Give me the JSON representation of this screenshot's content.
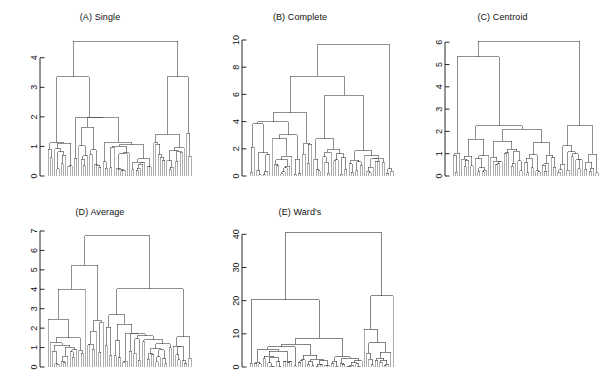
{
  "figure": {
    "background": "#ffffff",
    "line_color": "#333333",
    "leaf_color": "#8a8a8a",
    "text_color": "#111111",
    "layout": "2 rows x 3 columns (5 panels, bottom-right empty)"
  },
  "panels": [
    {
      "id": "A",
      "title": "(A) Single",
      "key": "single"
    },
    {
      "id": "B",
      "title": "(B) Complete",
      "key": "complete"
    },
    {
      "id": "C",
      "title": "(C) Centroid",
      "key": "centroid"
    },
    {
      "id": "D",
      "title": "(D) Average",
      "key": "average"
    },
    {
      "id": "E",
      "title": "(E) Ward's",
      "key": "wards"
    }
  ],
  "chart_data": [
    {
      "type": "dendrogram",
      "panel": "A",
      "title": "(A) Single",
      "linkage": "single",
      "xlabel": "",
      "ylabel": "",
      "ylim": [
        0,
        4.6
      ],
      "yticks": [
        0,
        1,
        2,
        3,
        4
      ],
      "ytick_labels": [
        "0",
        "1",
        "2",
        "3",
        "4"
      ],
      "grid": false,
      "n_leaves": 66,
      "root_height": 4.55,
      "merge_heights": [
        4.55,
        3.35,
        3.35,
        1.98,
        1.98,
        1.65,
        1.45,
        1.42,
        1.15,
        1.12,
        1.12,
        1.1,
        1.08,
        1.05,
        1.02,
        1.0,
        0.98,
        0.95,
        0.93,
        0.9,
        0.88,
        0.86,
        0.84,
        0.82,
        0.8,
        0.78,
        0.76,
        0.74,
        0.72,
        0.7,
        0.68,
        0.66,
        0.64,
        0.62,
        0.6,
        0.58,
        0.56,
        0.54,
        0.52,
        0.5,
        0.48,
        0.46,
        0.44,
        0.42,
        0.4,
        0.38,
        0.36,
        0.35,
        0.34,
        0.33,
        0.32,
        0.31,
        0.3,
        0.29,
        0.28,
        0.27,
        0.26,
        0.25,
        0.24,
        0.23,
        0.22,
        0.21,
        0.2,
        0.19,
        0.18
      ],
      "notes": "Strong chaining: one long spine at ~1.98 with most leaves merging below ~1.2"
    },
    {
      "type": "dendrogram",
      "panel": "B",
      "title": "(B) Complete",
      "linkage": "complete",
      "xlabel": "",
      "ylabel": "",
      "ylim": [
        0,
        10
      ],
      "yticks": [
        0,
        2,
        4,
        6,
        8,
        10
      ],
      "ytick_labels": [
        "0",
        "2",
        "4",
        "6",
        "8",
        "10"
      ],
      "grid": false,
      "n_leaves": 66,
      "root_height": 9.65,
      "merge_heights": [
        9.65,
        7.35,
        5.95,
        4.65,
        4.0,
        3.85,
        3.05,
        2.75,
        2.75,
        2.4,
        2.35,
        2.1,
        1.95,
        1.85,
        1.75,
        1.7,
        1.65,
        1.6,
        1.55,
        1.5,
        1.45,
        1.4,
        1.35,
        1.3,
        1.28,
        1.25,
        1.22,
        1.2,
        1.18,
        1.15,
        1.12,
        1.1,
        1.08,
        1.05,
        1.02,
        1.0,
        0.95,
        0.9,
        0.85,
        0.8,
        0.75,
        0.7,
        0.65,
        0.6,
        0.55,
        0.5,
        0.45,
        0.42,
        0.4,
        0.38,
        0.36,
        0.34,
        0.32,
        0.3,
        0.28,
        0.26,
        0.24,
        0.22,
        0.2,
        0.18,
        0.16,
        0.14,
        0.12,
        0.1,
        0.08
      ],
      "notes": "Balanced two-cluster split at 9.65; left small tight branch at 5.95"
    },
    {
      "type": "dendrogram",
      "panel": "C",
      "title": "(C) Centroid",
      "linkage": "centroid",
      "xlabel": "",
      "ylabel": "",
      "ylim": [
        0,
        6.1
      ],
      "yticks": [
        0,
        1,
        2,
        3,
        4,
        5,
        6
      ],
      "ytick_labels": [
        "0",
        "1",
        "2",
        "3",
        "4",
        "5",
        "6"
      ],
      "grid": false,
      "n_leaves": 66,
      "root_height": 6.05,
      "merge_heights": [
        6.05,
        5.35,
        2.25,
        2.25,
        2.1,
        1.65,
        1.55,
        1.5,
        1.35,
        1.2,
        1.1,
        1.08,
        1.05,
        1.03,
        1.02,
        1.0,
        0.98,
        0.96,
        0.94,
        0.92,
        0.9,
        0.88,
        0.86,
        0.84,
        0.82,
        0.8,
        0.78,
        0.76,
        0.74,
        0.72,
        0.7,
        0.68,
        0.66,
        0.64,
        0.62,
        0.6,
        0.58,
        0.56,
        0.54,
        0.52,
        0.5,
        0.48,
        0.46,
        0.44,
        0.42,
        0.4,
        0.38,
        0.36,
        0.34,
        0.32,
        0.3,
        0.28,
        0.26,
        0.25,
        0.24,
        0.23,
        0.22,
        0.21,
        0.2,
        0.19,
        0.18,
        0.17,
        0.16,
        0.15,
        0.14
      ],
      "notes": "Inversions visible; broad flat spine near 2.25, dense merges between 0.6 and 1.1"
    },
    {
      "type": "dendrogram",
      "panel": "D",
      "title": "(D) Average",
      "linkage": "average",
      "xlabel": "",
      "ylabel": "",
      "ylim": [
        0,
        7
      ],
      "yticks": [
        0,
        1,
        2,
        3,
        4,
        5,
        6,
        7
      ],
      "ytick_labels": [
        "0",
        "1",
        "2",
        "3",
        "4",
        "5",
        "6",
        "7"
      ],
      "grid": false,
      "n_leaves": 66,
      "root_height": 6.75,
      "merge_heights": [
        6.75,
        5.25,
        4.0,
        4.02,
        2.7,
        2.45,
        2.4,
        2.3,
        2.2,
        2.05,
        1.85,
        1.75,
        1.7,
        1.6,
        1.55,
        1.5,
        1.45,
        1.4,
        1.35,
        1.3,
        1.25,
        1.2,
        1.18,
        1.15,
        1.12,
        1.1,
        1.08,
        1.05,
        1.02,
        1.0,
        0.95,
        0.92,
        0.9,
        0.88,
        0.85,
        0.82,
        0.8,
        0.78,
        0.75,
        0.72,
        0.7,
        0.68,
        0.65,
        0.62,
        0.6,
        0.58,
        0.55,
        0.52,
        0.5,
        0.48,
        0.45,
        0.42,
        0.4,
        0.38,
        0.35,
        0.32,
        0.3,
        0.28,
        0.26,
        0.24,
        0.22,
        0.2,
        0.18,
        0.16,
        0.14
      ],
      "notes": "Root 6.75; right side has an isolated tall branch at ~4.0 near far right"
    },
    {
      "type": "dendrogram",
      "panel": "E",
      "title": "(E) Ward's",
      "linkage": "ward",
      "xlabel": "",
      "ylabel": "",
      "ylim": [
        0,
        41
      ],
      "yticks": [
        0,
        10,
        20,
        30,
        40
      ],
      "ytick_labels": [
        "0",
        "10",
        "20",
        "30",
        "40"
      ],
      "grid": false,
      "n_leaves": 66,
      "root_height": 40.5,
      "merge_heights": [
        40.5,
        21.5,
        20.3,
        11.4,
        8.6,
        7.3,
        6.9,
        6.1,
        5.3,
        4.8,
        4.4,
        4.1,
        3.6,
        3.3,
        3.1,
        2.9,
        2.7,
        2.6,
        2.5,
        2.4,
        2.3,
        2.2,
        2.1,
        2.0,
        1.95,
        1.9,
        1.85,
        1.8,
        1.75,
        1.7,
        1.65,
        1.6,
        1.55,
        1.5,
        1.45,
        1.4,
        1.35,
        1.3,
        1.25,
        1.2,
        1.15,
        1.1,
        1.05,
        1.0,
        0.95,
        0.9,
        0.85,
        0.8,
        0.75,
        0.7,
        0.65,
        0.6,
        0.55,
        0.5,
        0.45,
        0.4,
        0.35,
        0.3,
        0.28,
        0.26,
        0.24,
        0.22,
        0.2,
        0.18,
        0.16
      ],
      "notes": "Very balanced; two main clusters at 20.3 and 21.5 merging at 40.5"
    }
  ]
}
